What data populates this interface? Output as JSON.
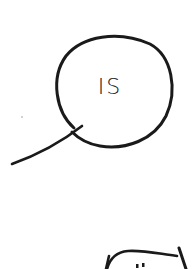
{
  "sketch": {
    "bubble_text": "IS",
    "bottom_marks": "..",
    "stroke_color": "#1a1a1a",
    "background_color": "#ffffff"
  }
}
